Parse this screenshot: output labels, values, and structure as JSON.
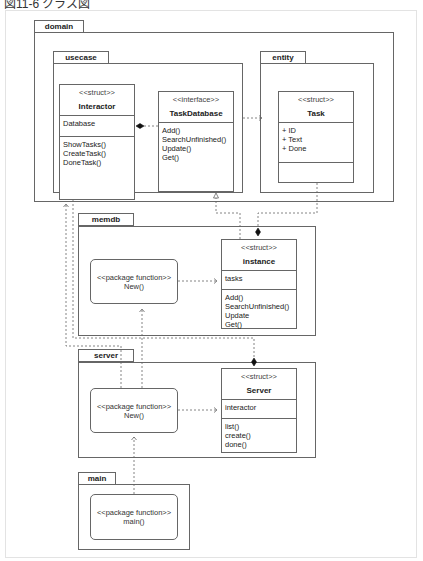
{
  "caption": "図11-6 クラス図",
  "packages": {
    "domain": {
      "label": "domain"
    },
    "usecase": {
      "label": "usecase"
    },
    "entity": {
      "label": "entity"
    },
    "memdb": {
      "label": "memdb"
    },
    "server": {
      "label": "server"
    },
    "main": {
      "label": "main"
    }
  },
  "classes": {
    "interactor": {
      "stereotype": "<<struct>>",
      "name": "Interactor",
      "fields": [
        "Database"
      ],
      "methods": [
        "ShowTasks()",
        "CreateTask()",
        "DoneTask()"
      ]
    },
    "taskdatabase": {
      "stereotype": "<<interface>>",
      "name": "TaskDatabase",
      "methods": [
        "Add()",
        "SearchUnfinished()",
        "Update()",
        "Get()"
      ]
    },
    "task": {
      "stereotype": "<<struct>>",
      "name": "Task",
      "fields": [
        "+ ID",
        "+ Text",
        "+ Done"
      ]
    },
    "instance": {
      "stereotype": "<<struct>>",
      "name": "instance",
      "fields": [
        "tasks"
      ],
      "methods": [
        "Add()",
        "SearchUnfinished()",
        "Update",
        "Get()"
      ]
    },
    "server": {
      "stereotype": "<<struct>>",
      "name": "Server",
      "fields": [
        "interactor"
      ],
      "methods": [
        "list()",
        "create()",
        "done()"
      ]
    }
  },
  "functions": {
    "memdb_new": {
      "stereotype": "<<package function>>",
      "name": "New()"
    },
    "server_new": {
      "stereotype": "<<package function>>",
      "name": "New()"
    },
    "main_main": {
      "stereotype": "<<package function>>",
      "name": "main()"
    }
  },
  "colors": {
    "line": "#666666",
    "border": "#666666",
    "frame": "#e3e3e3"
  }
}
